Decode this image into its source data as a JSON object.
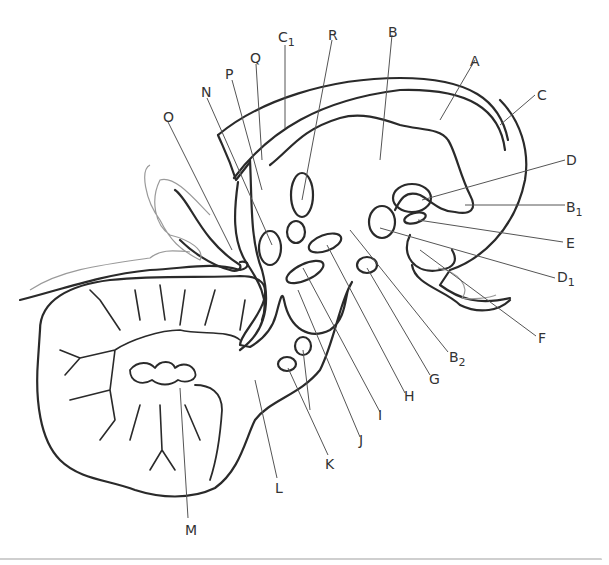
{
  "diagram": {
    "type": "anatomical-sagittal-section",
    "stroke_color": "#2a2a2a",
    "leader_color": "#555555",
    "labels": [
      {
        "id": "A",
        "text": "A",
        "sub": "",
        "x": 470,
        "y": 54
      },
      {
        "id": "B",
        "text": "B",
        "sub": "",
        "x": 388,
        "y": 25
      },
      {
        "id": "C",
        "text": "C",
        "sub": "",
        "x": 537,
        "y": 88
      },
      {
        "id": "C1",
        "text": "C",
        "sub": "1",
        "x": 278,
        "y": 30
      },
      {
        "id": "D",
        "text": "D",
        "sub": "",
        "x": 566,
        "y": 153
      },
      {
        "id": "B1",
        "text": "B",
        "sub": "1",
        "x": 566,
        "y": 200
      },
      {
        "id": "E",
        "text": "E",
        "sub": "",
        "x": 566,
        "y": 236
      },
      {
        "id": "D1",
        "text": "D",
        "sub": "1",
        "x": 557,
        "y": 270
      },
      {
        "id": "F",
        "text": "F",
        "sub": "",
        "x": 538,
        "y": 331
      },
      {
        "id": "B2",
        "text": "B",
        "sub": "2",
        "x": 449,
        "y": 350
      },
      {
        "id": "G",
        "text": "G",
        "sub": "",
        "x": 429,
        "y": 372
      },
      {
        "id": "H",
        "text": "H",
        "sub": "",
        "x": 404,
        "y": 389
      },
      {
        "id": "I",
        "text": "I",
        "sub": "",
        "x": 378,
        "y": 408
      },
      {
        "id": "J",
        "text": "J",
        "sub": "",
        "x": 359,
        "y": 433
      },
      {
        "id": "K",
        "text": "K",
        "sub": "",
        "x": 325,
        "y": 457
      },
      {
        "id": "L",
        "text": "L",
        "sub": "",
        "x": 275,
        "y": 481
      },
      {
        "id": "M",
        "text": "M",
        "sub": "",
        "x": 185,
        "y": 523
      },
      {
        "id": "N",
        "text": "N",
        "sub": "",
        "x": 201,
        "y": 85
      },
      {
        "id": "O",
        "text": "O",
        "sub": "",
        "x": 163,
        "y": 110
      },
      {
        "id": "P",
        "text": "P",
        "sub": "",
        "x": 225,
        "y": 67
      },
      {
        "id": "Q",
        "text": "Q",
        "sub": "",
        "x": 250,
        "y": 51
      },
      {
        "id": "R",
        "text": "R",
        "sub": "",
        "x": 328,
        "y": 28
      }
    ]
  }
}
